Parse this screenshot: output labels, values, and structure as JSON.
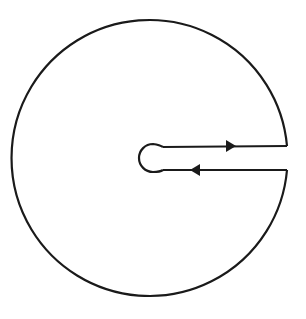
{
  "diagram": {
    "type": "keyhole-contour",
    "stroke_color": "#1a1a1a",
    "background": "#ffffff",
    "outer_circle": {
      "cx": 153,
      "cy": 160,
      "r": 138
    },
    "inner_circle": {
      "cx": 152,
      "cy": 158,
      "r": 14
    },
    "upper_line": {
      "y": 146,
      "x_start": 164,
      "x_end": 287,
      "arrow_direction": "right",
      "arrow_x": 230
    },
    "lower_line": {
      "y": 170,
      "x_start": 164,
      "x_end": 287,
      "arrow_direction": "left",
      "arrow_x": 196
    }
  }
}
